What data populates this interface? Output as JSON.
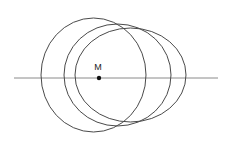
{
  "figure": {
    "background_color": "#ffffff",
    "line": {
      "x1": 14,
      "y1": 78,
      "x2": 218,
      "y2": 78,
      "color": "#8a8a8a",
      "width": 1
    },
    "ellipses": [
      {
        "name": "circle-left",
        "cx": 93.5,
        "cy": 75,
        "rx": 52.5,
        "ry": 57
      },
      {
        "name": "circle-middle",
        "cx": 117.5,
        "cy": 75,
        "rx": 53.5,
        "ry": 51
      },
      {
        "name": "circle-right",
        "cx": 130.5,
        "cy": 75,
        "rx": 55.5,
        "ry": 47
      }
    ],
    "ellipse_style": {
      "stroke": "#4a4a4a",
      "stroke_width": 1,
      "fill": "none"
    },
    "point": {
      "label": "M",
      "x": 99,
      "y": 78,
      "r": 2.2,
      "dot_color": "#111111",
      "label_x": 98,
      "label_y": 70
    }
  }
}
